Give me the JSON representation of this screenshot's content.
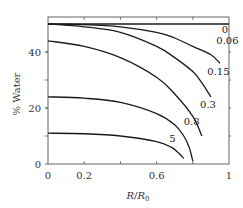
{
  "chart_data": {
    "type": "line",
    "title": "",
    "xlabel": "R/R0",
    "ylabel": "% Water",
    "xlim": [
      0,
      1
    ],
    "ylim": [
      0,
      50
    ],
    "x_ticks": [
      0,
      0.2,
      0.6,
      1
    ],
    "x_tick_labels": [
      "0",
      "0.2",
      "0.6",
      "1"
    ],
    "y_ticks": [
      0,
      20,
      40
    ],
    "y_tick_labels": [
      "0",
      "20",
      "40"
    ],
    "grid": false,
    "legend": "inline curve labels",
    "series": [
      {
        "name": "0",
        "x": [
          0,
          0.2,
          0.4,
          0.6,
          0.8,
          1.0
        ],
        "y": [
          50,
          50,
          50,
          50,
          50,
          50
        ]
      },
      {
        "name": "0.06",
        "x": [
          0,
          0.2,
          0.4,
          0.6,
          0.7,
          0.8,
          0.9,
          0.95
        ],
        "y": [
          50,
          49.8,
          49,
          47,
          45,
          42,
          39,
          36
        ]
      },
      {
        "name": "0.15",
        "x": [
          0,
          0.2,
          0.4,
          0.6,
          0.7,
          0.8,
          0.85,
          0.9
        ],
        "y": [
          50,
          49,
          47,
          42,
          38,
          33,
          29,
          24
        ]
      },
      {
        "name": "0.3",
        "x": [
          0,
          0.2,
          0.4,
          0.6,
          0.7,
          0.8,
          0.85
        ],
        "y": [
          44,
          42,
          38,
          31,
          25,
          17,
          10
        ]
      },
      {
        "name": "0.8",
        "x": [
          0,
          0.2,
          0.4,
          0.6,
          0.7,
          0.75,
          0.78,
          0.8
        ],
        "y": [
          24,
          23.5,
          22,
          18,
          14,
          10,
          6,
          1
        ]
      },
      {
        "name": "5",
        "x": [
          0,
          0.2,
          0.4,
          0.6,
          0.68,
          0.72,
          0.75
        ],
        "y": [
          11,
          10.8,
          10,
          8,
          6,
          4,
          2
        ]
      }
    ],
    "curve_labels": [
      {
        "text": "0",
        "x": 0.96,
        "y": 48
      },
      {
        "text": "0.06",
        "x": 0.93,
        "y": 44
      },
      {
        "text": "0.15",
        "x": 0.88,
        "y": 33
      },
      {
        "text": "0.3",
        "x": 0.84,
        "y": 21
      },
      {
        "text": "0.8",
        "x": 0.75,
        "y": 15
      },
      {
        "text": "5",
        "x": 0.67,
        "y": 9
      }
    ]
  }
}
